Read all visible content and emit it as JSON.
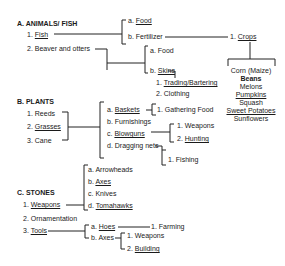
{
  "sections": {
    "animals": {
      "heading": "A. ANIMALS/ FISH",
      "items": [
        {
          "num": "1.",
          "label": "Fish"
        },
        {
          "num": "2.",
          "label": "Beaver and otters"
        }
      ],
      "fish_uses": [
        {
          "letter": "a.",
          "label": "Food"
        },
        {
          "letter": "b.",
          "label": "Fertilizer"
        }
      ],
      "fertilizer_use": {
        "num": "1.",
        "label": "Crops"
      },
      "crops": [
        "Corn (Maize)",
        "Beans",
        "Melons",
        "Pumpkins",
        "Squash",
        "Sweet Potatoes",
        "Sunflowers"
      ],
      "beaver_uses": [
        {
          "letter": "a.",
          "label": "Food"
        },
        {
          "letter": "b.",
          "label": "Skins"
        }
      ],
      "skins_uses": [
        {
          "num": "1.",
          "label": "Trading/Bartering"
        },
        {
          "num": "2.",
          "label": "Clothing"
        }
      ]
    },
    "plants": {
      "heading": "B. PLANTS",
      "items": [
        {
          "num": "1.",
          "label": "Reeds"
        },
        {
          "num": "2.",
          "label": "Grasses"
        },
        {
          "num": "3.",
          "label": "Cane"
        }
      ],
      "uses": [
        {
          "letter": "a.",
          "label": "Baskets"
        },
        {
          "letter": "b.",
          "label": "Furnishings"
        },
        {
          "letter": "c.",
          "label": "Blowguns"
        },
        {
          "letter": "d.",
          "label": "Dragging nets"
        }
      ],
      "baskets_uses": [
        {
          "num": "1.",
          "label": "Gathering Food"
        }
      ],
      "blowguns_uses": [
        {
          "num": "1.",
          "label": "Weapons"
        },
        {
          "num": "2.",
          "label": "Hunting"
        }
      ],
      "nets_uses": [
        {
          "num": "1.",
          "label": "Fishing"
        }
      ]
    },
    "stones": {
      "heading": "C. STONES",
      "items": [
        {
          "num": "1.",
          "label": "Weapons"
        },
        {
          "num": "2.",
          "label": "Ornamentation"
        },
        {
          "num": "3.",
          "label": "Tools"
        }
      ],
      "weapons": [
        {
          "letter": "a.",
          "label": "Arrowheads"
        },
        {
          "letter": "b.",
          "label": "Axes"
        },
        {
          "letter": "c.",
          "label": "Knives"
        },
        {
          "letter": "d.",
          "label": "Tomahawks"
        }
      ],
      "tools": [
        {
          "letter": "a.",
          "label": "Hoes"
        },
        {
          "letter": "b.",
          "label": "Axes"
        }
      ],
      "hoes_uses": [
        {
          "num": "1.",
          "label": "Farming"
        }
      ],
      "axes_uses": [
        {
          "num": "1.",
          "label": "Weapons"
        },
        {
          "num": "2.",
          "label": "Building"
        }
      ]
    }
  }
}
